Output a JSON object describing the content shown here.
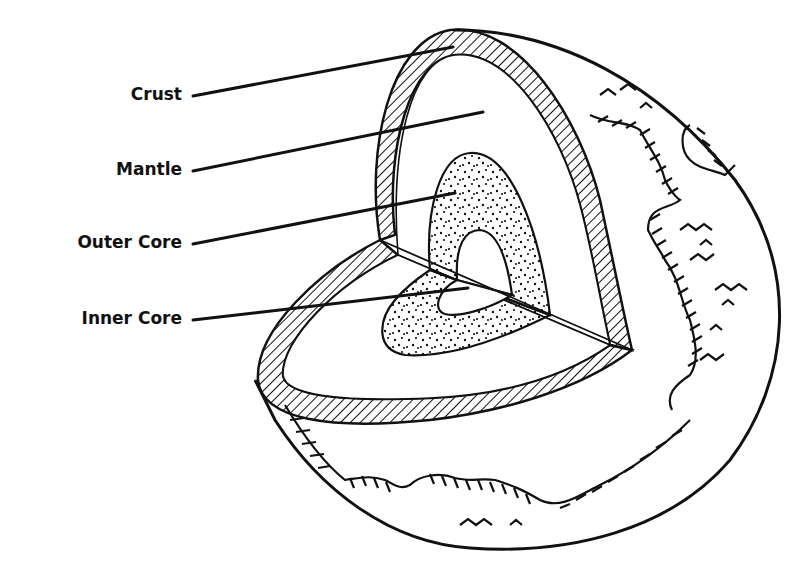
{
  "diagram": {
    "type": "cutaway-diagram",
    "labels": [
      {
        "id": "crust",
        "text": "Crust"
      },
      {
        "id": "mantle",
        "text": "Mantle"
      },
      {
        "id": "outer_core",
        "text": "Outer Core"
      },
      {
        "id": "inner_core",
        "text": "Inner Core"
      }
    ],
    "fills": {
      "crust": "diagonal-hatch",
      "mantle": "blank",
      "outer_core": "stippled-dots",
      "inner_core": "blank"
    },
    "colors": {
      "ink": "#111111",
      "background": "#ffffff"
    }
  }
}
